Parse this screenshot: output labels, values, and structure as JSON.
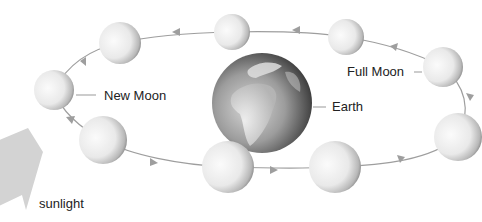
{
  "diagram": {
    "labels": {
      "new_moon": "New Moon",
      "full_moon": "Full Moon",
      "earth": "Earth",
      "sunlight": "sunlight"
    },
    "earth": {
      "cx": 262,
      "cy": 103,
      "r": 50
    },
    "moons": [
      {
        "id": "moon-1",
        "cx": 54,
        "cy": 90,
        "r": 20,
        "phase": "new"
      },
      {
        "id": "moon-2",
        "cx": 120,
        "cy": 43,
        "r": 21
      },
      {
        "id": "moon-3",
        "cx": 232,
        "cy": 32,
        "r": 18
      },
      {
        "id": "moon-4",
        "cx": 346,
        "cy": 37,
        "r": 18
      },
      {
        "id": "moon-5",
        "cx": 443,
        "cy": 67,
        "r": 20,
        "phase": "full"
      },
      {
        "id": "moon-6",
        "cx": 458,
        "cy": 137,
        "r": 24
      },
      {
        "id": "moon-7",
        "cx": 335,
        "cy": 167,
        "r": 26
      },
      {
        "id": "moon-8",
        "cx": 228,
        "cy": 167,
        "r": 26
      },
      {
        "id": "moon-9",
        "cx": 103,
        "cy": 140,
        "r": 24
      }
    ],
    "colors": {
      "orbit": "#9a9a9a",
      "sunlight_arrow": "#cfcfcf",
      "text": "#222222"
    }
  }
}
